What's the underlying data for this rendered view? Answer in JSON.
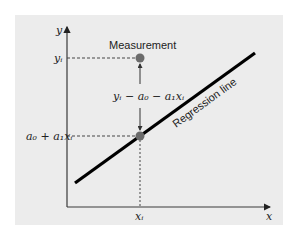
{
  "diagram": {
    "labels": {
      "y_axis": "y",
      "x_axis": "x",
      "y_i": "yᵢ",
      "x_i": "xᵢ",
      "fitted": "a₀ + a₁xᵢ",
      "residual": "yᵢ − a₀ − a₁xᵢ",
      "measurement": "Measurement",
      "regression_line": "Regression line"
    },
    "colors": {
      "background": "#ececec",
      "axis": "#3a3a3a",
      "line": "#000000",
      "point": "#6b6b6b",
      "dashed": "#444444"
    }
  }
}
